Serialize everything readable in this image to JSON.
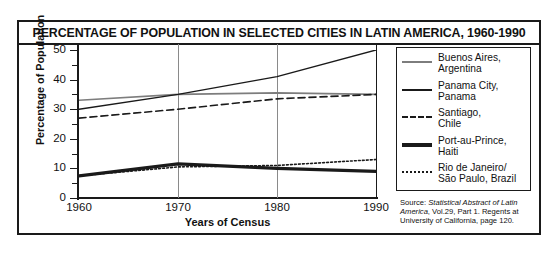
{
  "chart_data": {
    "type": "line",
    "title": "PERCENTAGE OF POPULATION IN SELECTED CITIES IN LATIN AMERICA, 1960-1990",
    "xlabel": "Years of Census",
    "ylabel": "Percentage of Population",
    "x": [
      1960,
      1970,
      1980,
      1990
    ],
    "xtick_labels": [
      "1960",
      "1970",
      "1980",
      "1990"
    ],
    "ytick_labels": [
      "0",
      "10",
      "20",
      "30",
      "40",
      "50"
    ],
    "ylim": [
      0,
      50
    ],
    "xlim": [
      1960,
      1990
    ],
    "grid": "vertical-at-1970-and-1980",
    "legend_position": "right-outside",
    "series": [
      {
        "name": "Buenos Aires, Argentina",
        "label_line1": "Buenos Aires,",
        "label_line2": "Argentina",
        "style": "solid",
        "color": "#7d7d7d",
        "width": 1.6,
        "values": [
          33,
          35,
          35.5,
          35
        ]
      },
      {
        "name": "Panama City, Panama",
        "label_line1": "Panama City,",
        "label_line2": "Panama",
        "style": "solid",
        "color": "#1a1a1a",
        "width": 1.4,
        "values": [
          30,
          35,
          41,
          50
        ]
      },
      {
        "name": "Santiago, Chile",
        "label_line1": "Santiago,",
        "label_line2": "Chile",
        "style": "dashed",
        "color": "#1a1a1a",
        "width": 1.6,
        "values": [
          27,
          30,
          33.5,
          35
        ]
      },
      {
        "name": "Port-au-Prince, Haiti",
        "label_line1": "Port-au-Prince,",
        "label_line2": "Haiti",
        "style": "solid-thick",
        "color": "#1a1a1a",
        "width": 3.2,
        "values": [
          7.5,
          11.5,
          10,
          9
        ]
      },
      {
        "name": "Rio de Janeiro/Sao Paulo, Brazil",
        "label_line1": "Rio de Janeiro/",
        "label_line2": "São Paulo, Brazil",
        "style": "dotted",
        "color": "#1a1a1a",
        "width": 1.6,
        "values": [
          7.5,
          10.5,
          11,
          13
        ]
      }
    ]
  },
  "source": {
    "prefix": "Source: ",
    "italic_part": "Statistical Abstract of Latin America",
    "rest": ", Vol.29, Part 1. Regents at University of California, page 120."
  }
}
